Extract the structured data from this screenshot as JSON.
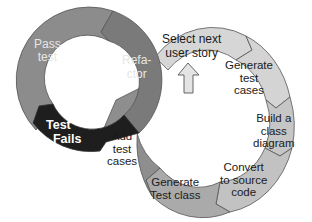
{
  "diagram": {
    "type": "two-interlocking-cycles",
    "colors": {
      "left_ring": "#8c8c8c",
      "left_refactor": "#7a7a7a",
      "test_fails": "#1e1e1e",
      "right_ring_light": "#d6d6d6",
      "right_ring_mid": "#b4b4b4",
      "right_ring_dark": "#8e8e8e",
      "outline": "#555555"
    },
    "left_cycle": {
      "segments": [
        {
          "id": "pass-test",
          "label": "Pass\ntest"
        },
        {
          "id": "refactor",
          "label": "Refa-\nctor"
        },
        {
          "id": "test-fails",
          "label": "Test\n  Fails"
        }
      ]
    },
    "right_cycle": {
      "segments": [
        {
          "id": "select-next-user-story",
          "label": "Select next\nuser story"
        },
        {
          "id": "generate-test-cases",
          "label": "Generate\ntest\ncases"
        },
        {
          "id": "build-class-diagram",
          "label": "Build a\nclass\ndiagram"
        },
        {
          "id": "convert-to-source-code",
          "label": "Convert\nto source\ncode"
        },
        {
          "id": "generate-test-class",
          "label": "Generate\nTest class"
        },
        {
          "id": "add-test-cases",
          "label": "Add\ntest\ncases"
        }
      ]
    },
    "start_marker": {
      "icon": "up-arrow-icon"
    }
  }
}
